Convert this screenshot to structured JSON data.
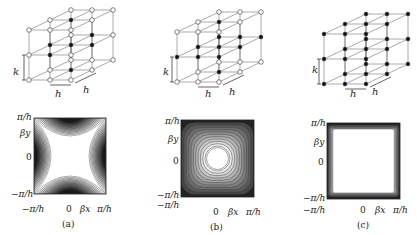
{
  "figure": {
    "panels": [
      {
        "caption": "(a)",
        "lattice": {
          "type": "body-centered-like",
          "k_label": "k",
          "h_label_front": "h",
          "h_label_depth": "h"
        },
        "contour": {
          "pattern": "saddle",
          "y_top": "π/h",
          "y_mid": "0",
          "y_bottom": "−π/h",
          "y_axis": "βy",
          "x_left": "−π/h",
          "x_mid": "0",
          "x_axis": "βx",
          "x_right": "π/h"
        }
      },
      {
        "caption": "(b)",
        "lattice": {
          "type": "face-centered-like",
          "k_label": "k",
          "h_label_front": "h",
          "h_label_depth": "h"
        },
        "contour": {
          "pattern": "circular-to-square",
          "y_top": "π/h",
          "y_mid": "0",
          "y_bottom": "−π/h",
          "y_axis": "βy",
          "x_left": "−π/h",
          "x_mid": "0",
          "x_axis": "βx",
          "x_right": "π/h"
        }
      },
      {
        "caption": "(c)",
        "lattice": {
          "type": "simple-cubic",
          "k_label": "k",
          "h_label_front": "h",
          "h_label_depth": "h"
        },
        "contour": {
          "pattern": "square",
          "y_top": "π/h",
          "y_mid": "0",
          "y_bottom": "−π/h",
          "y_axis": "βy",
          "x_left": "−π/h",
          "x_mid": "0",
          "x_axis": "βx",
          "x_right": "π/h"
        }
      }
    ],
    "colors": {
      "line": "#555555",
      "node_fill_dark": "#111111",
      "node_fill_open": "#ffffff",
      "contour_dark": "#1a1a1a"
    }
  }
}
